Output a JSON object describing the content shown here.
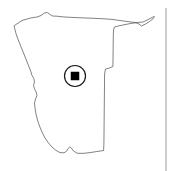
{
  "widget": {
    "name": "country-locator-map",
    "title": "Namibia",
    "subject": "Namibia country outline map with location marker",
    "background_color": "#ffffff",
    "outline_color": "#4d4d4d",
    "marker_color": "#000000",
    "divider_color": "#9a9a9a",
    "width": 173,
    "height": 171
  },
  "map": {
    "country_name": "Namibia",
    "outline_path": "M 14.5 25.5 L 22 20.5 L 30.5 18.0 L 37.0 17.0 L 41.0 15.5 L 44.5 13.0 L 47.5 12.5 L 50.0 14.5 L 52.5 16.0 L 57.0 16.2 L 62.0 16.8 L 68.0 17.2 L 76.0 17.6 L 86.0 18.0 L 96.0 18.4 L 104.0 18.8 L 112.0 19.4 L 120.0 20.5 L 128.0 21.6 L 136.0 22.6 L 143.0 22.0 L 148.0 19.6 L 152.5 17.2 L 154.5 16.6 L 153.0 18.8 L 149.5 21.5 L 145.5 24.0 L 141.5 26.0 L 139.0 24.0 L 136.0 22.8 L 131.0 23.4 L 125.0 24.6 L 119.0 25.8 L 114.5 27.0 L 113.5 30.0 L 113.3 36.0 L 113.2 44.0 L 113.1 52.0 L 113.0 60.0 L 112.9 66.5 L 109.0 68.2 L 105.5 69.0 L 104.6 74.0 L 104.5 84.0 L 104.4 94.0 L 104.3 104.0 L 104.2 114.0 L 104.1 124.0 L 104.0 134.0 L 103.9 144.0 L 103.6 150.5 L 97.0 151.5 L 90.0 152.6 L 83.0 153.4 L 77.0 153.2 L 73.5 151.0 L 71.5 148.2 L 69.8 146.8 L 68.2 148.4 L 66.8 151.0 L 64.0 152.8 L 60.0 152.6 L 56.0 150.4 L 52.0 147.0 L 48.5 143.0 L 45.0 138.0 L 42.0 132.0 L 39.5 126.0 L 37.5 120.0 L 36.0 114.0 L 35.0 108.0 L 34.5 103.0 L 35.5 99.0 L 37.0 95.5 L 36.2 92.0 L 34.5 89.0 L 33.5 85.5 L 34.5 82.0 L 33.8 78.5 L 32.0 75.5 L 31.0 72.0 L 29.5 68.0 L 27.5 63.0 L 25.5 58.0 L 23.5 53.0 L 21.5 48.0 L 19.5 43.0 L 17.5 38.0 L 16.0 33.5 L 14.8 29.0 Z",
    "marker": {
      "label": "location-marker",
      "center_x": 75,
      "center_y": 76,
      "ring_radius": 10.5,
      "square_size": 8.5
    },
    "divider": {
      "label": "panel-divider",
      "x": 166,
      "y_start": 8,
      "y_end": 171
    }
  }
}
